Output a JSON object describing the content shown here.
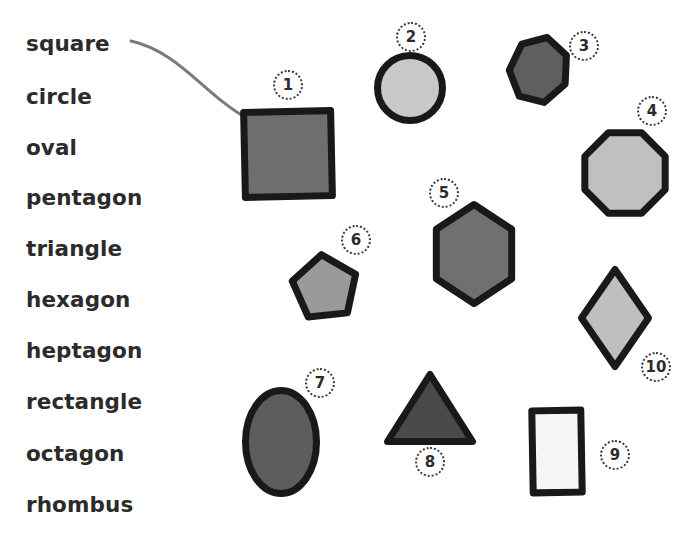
{
  "page": {
    "background_color": "#ffffff",
    "width": 700,
    "height": 534
  },
  "word_list": {
    "text_color": "#2b2b2b",
    "items": [
      {
        "label": "square",
        "x": 26,
        "y": 33
      },
      {
        "label": "circle",
        "x": 26,
        "y": 86
      },
      {
        "label": "oval",
        "x": 26,
        "y": 137
      },
      {
        "label": "pentagon",
        "x": 26,
        "y": 187
      },
      {
        "label": "triangle",
        "x": 26,
        "y": 238
      },
      {
        "label": "hexagon",
        "x": 26,
        "y": 289
      },
      {
        "label": "heptagon",
        "x": 26,
        "y": 340
      },
      {
        "label": "rectangle",
        "x": 26,
        "y": 391
      },
      {
        "label": "octagon",
        "x": 26,
        "y": 443
      },
      {
        "label": "rhombus",
        "x": 26,
        "y": 494
      }
    ]
  },
  "connector": {
    "name": "square-to-shape-1-curve",
    "color": "#7a7a7a",
    "from_label": "square",
    "to_shape_number": "1",
    "path": "M 131 41 C 180 52, 205 96, 250 120"
  },
  "shapes": [
    {
      "number": "1",
      "kind": "square",
      "fill": "#6e6e6e",
      "stroke": "#191919",
      "x": 241,
      "y": 108,
      "w": 94,
      "h": 92,
      "rotation": -1.2,
      "badge": {
        "x": 273,
        "y": 70
      }
    },
    {
      "number": "2",
      "kind": "circle",
      "fill": "#c8c8c8",
      "stroke": "#191919",
      "x": 374,
      "y": 52,
      "w": 72,
      "h": 72,
      "rotation": 0,
      "badge": {
        "x": 396,
        "y": 22
      }
    },
    {
      "number": "3",
      "kind": "heptagon",
      "fill": "#5f5f5f",
      "stroke": "#191919",
      "x": 506,
      "y": 33,
      "w": 66,
      "h": 74,
      "rotation": 14,
      "badge": {
        "x": 569,
        "y": 31
      }
    },
    {
      "number": "4",
      "kind": "octagon",
      "fill": "#c0c0c0",
      "stroke": "#191919",
      "x": 578,
      "y": 126,
      "w": 94,
      "h": 94,
      "rotation": 0,
      "badge": {
        "x": 637,
        "y": 96
      }
    },
    {
      "number": "5",
      "kind": "hexagon",
      "fill": "#707070",
      "stroke": "#191919",
      "x": 427,
      "y": 201,
      "w": 94,
      "h": 106,
      "rotation": 0,
      "badge": {
        "x": 429,
        "y": 178
      }
    },
    {
      "number": "6",
      "kind": "pentagon",
      "fill": "#9a9a9a",
      "stroke": "#191919",
      "x": 288,
      "y": 251,
      "w": 74,
      "h": 74,
      "rotation": -6,
      "badge": {
        "x": 341,
        "y": 225
      }
    },
    {
      "number": "7",
      "kind": "oval",
      "fill": "#5d5d5d",
      "stroke": "#191919",
      "x": 242,
      "y": 387,
      "w": 78,
      "h": 110,
      "rotation": 0,
      "badge": {
        "x": 305,
        "y": 368
      }
    },
    {
      "number": "8",
      "kind": "triangle",
      "fill": "#4a4a4a",
      "stroke": "#191919",
      "x": 384,
      "y": 371,
      "w": 92,
      "h": 74,
      "rotation": 0,
      "badge": {
        "x": 415,
        "y": 447
      }
    },
    {
      "number": "9",
      "kind": "rectangle",
      "fill": "#f5f5f5",
      "stroke": "#191919",
      "x": 529,
      "y": 407,
      "w": 56,
      "h": 89,
      "rotation": -1,
      "badge": {
        "x": 600,
        "y": 440
      }
    },
    {
      "number": "10",
      "kind": "rhombus",
      "fill": "#bfbfbf",
      "stroke": "#191919",
      "x": 578,
      "y": 266,
      "w": 74,
      "h": 104,
      "rotation": 0,
      "badge": {
        "x": 641,
        "y": 352
      }
    }
  ]
}
